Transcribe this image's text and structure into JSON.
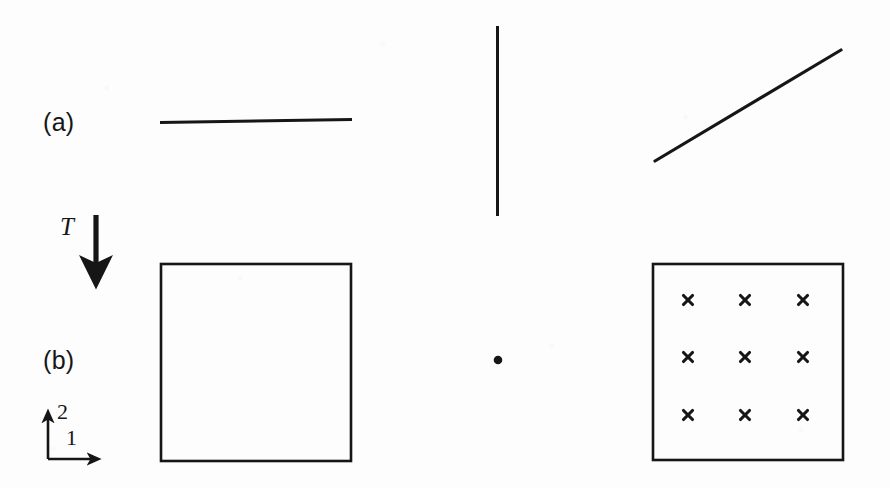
{
  "figure": {
    "background_color": "#fdfdfd",
    "ink_color": "#161616",
    "width": 890,
    "height": 488
  },
  "labels": {
    "row_a": "(a)",
    "row_b": "(b)",
    "map": "T",
    "axis_1": "1",
    "axis_2": "2"
  },
  "axes": {
    "name": "reference-frame",
    "origin": {
      "x": 48,
      "y": 459
    },
    "axis_1": {
      "direction": "right",
      "length": 52,
      "label": "1"
    },
    "axis_2": {
      "direction": "up",
      "length": 49,
      "label": "2"
    }
  },
  "arrow": {
    "name": "transformation-arrow",
    "label": "T",
    "from": {
      "x": 96,
      "y": 215
    },
    "to": {
      "x": 96,
      "y": 291
    },
    "direction": "down"
  },
  "row_a_shapes": [
    {
      "name": "horizontal-line",
      "type": "line",
      "x1": 160,
      "y1": 122,
      "x2": 352,
      "y2": 119,
      "stroke_width": 3
    },
    {
      "name": "vertical-line",
      "type": "line",
      "x1": 497,
      "y1": 26,
      "x2": 497,
      "y2": 216,
      "stroke_width": 3
    },
    {
      "name": "diagonal-line",
      "type": "line",
      "x1": 655,
      "y1": 161,
      "x2": 841,
      "y2": 50,
      "stroke_width": 3
    }
  ],
  "row_b_shapes": [
    {
      "name": "element-square-plain",
      "type": "rect",
      "x": 161,
      "y": 264,
      "width": 190,
      "height": 197,
      "stroke_width": 2.4,
      "fill": "none"
    },
    {
      "name": "center-point",
      "type": "dot",
      "cx": 498,
      "cy": 360,
      "r": 4.2
    },
    {
      "name": "element-square-gauss",
      "type": "rect",
      "x": 653,
      "y": 264,
      "width": 190,
      "height": 196,
      "stroke_width": 2.4,
      "fill": "none"
    }
  ],
  "gauss_points": {
    "name": "gauss-point-grid",
    "marker": "x",
    "rows": 3,
    "columns": 3,
    "count": 9,
    "cx_positions": [
      688,
      745,
      803
    ],
    "cy_positions": [
      300,
      357,
      415
    ],
    "marker_size": 11,
    "stroke_width": 3
  }
}
